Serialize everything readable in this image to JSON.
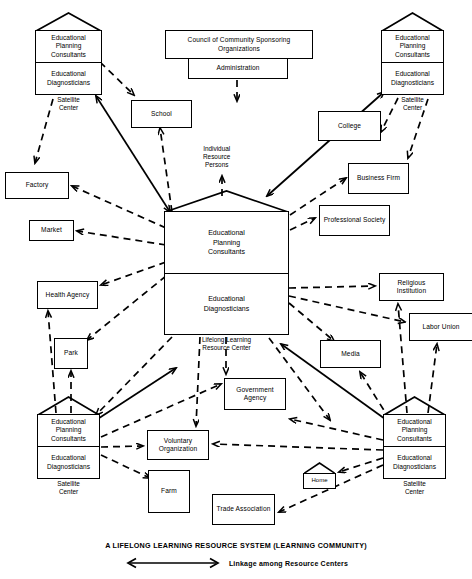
{
  "diagram": {
    "title": "A LIFELONG LEARNING RESOURCE SYSTEM (LEARNING COMMUNITY)",
    "legend": {
      "arrow_icon": "double-headed-arrow-icon",
      "text": "Linkage among Resource Centers"
    },
    "colors": {
      "stroke": "#000000",
      "background": "#ffffff"
    },
    "center": {
      "top_cell": "Educational\nPlanning\nConsultants",
      "top_cell_lines": [
        "Educational",
        "Planning",
        "Consultants"
      ],
      "bottom_cell_lines": [
        "Educational",
        "Diagnosticians"
      ],
      "caption_lines": [
        "Lifelong Learning",
        "Resource Center"
      ]
    },
    "satellites": [
      {
        "id": "satellite-top-left",
        "top_cell_lines": [
          "Educational",
          "Planning",
          "Consultants"
        ],
        "bottom_cell_lines": [
          "Educational",
          "Diagnosticians"
        ],
        "caption_lines": [
          "Satellite",
          "Center"
        ]
      },
      {
        "id": "satellite-top-right",
        "top_cell_lines": [
          "Educational",
          "Planning",
          "Consultants"
        ],
        "bottom_cell_lines": [
          "Educational",
          "Diagnosticians"
        ],
        "caption_lines": [
          "Satellite",
          "Center"
        ]
      },
      {
        "id": "satellite-bottom-left",
        "top_cell_lines": [
          "Educational",
          "Planning",
          "Consultants"
        ],
        "bottom_cell_lines": [
          "Educational",
          "Diagnosticians"
        ],
        "caption_lines": [
          "Satellite",
          "Center"
        ]
      },
      {
        "id": "satellite-bottom-right",
        "top_cell_lines": [
          "Educational",
          "Planning",
          "Consultants"
        ],
        "bottom_cell_lines": [
          "Educational",
          "Diagnosticians"
        ],
        "caption_lines": [
          "Satellite",
          "Center"
        ]
      }
    ],
    "nodes": [
      {
        "id": "council",
        "label": "Council of Community Sponsoring Organizations"
      },
      {
        "id": "administration",
        "label": "Administration"
      },
      {
        "id": "school",
        "label": "School"
      },
      {
        "id": "college",
        "label": "College"
      },
      {
        "id": "business-firm",
        "label": "Business Firm"
      },
      {
        "id": "professional-society",
        "label": "Professional Society"
      },
      {
        "id": "factory",
        "label": "Factory"
      },
      {
        "id": "market",
        "label": "Market"
      },
      {
        "id": "health-agency",
        "label": "Health Agency"
      },
      {
        "id": "park",
        "label": "Park"
      },
      {
        "id": "religious-institution",
        "label": "Religious Institution"
      },
      {
        "id": "labor-union",
        "label": "Labor Union"
      },
      {
        "id": "media",
        "label": "Media"
      },
      {
        "id": "government-agency",
        "label": "Government Agency"
      },
      {
        "id": "voluntary-organization",
        "label": "Voluntary Organization"
      },
      {
        "id": "farm",
        "label": "Farm"
      },
      {
        "id": "home",
        "label": "Home"
      },
      {
        "id": "trade-association",
        "label": "Trade Association"
      }
    ],
    "floating_labels": [
      {
        "id": "individual-resource-persons",
        "lines": [
          "Individual",
          "Resource",
          "Persons"
        ]
      }
    ]
  }
}
